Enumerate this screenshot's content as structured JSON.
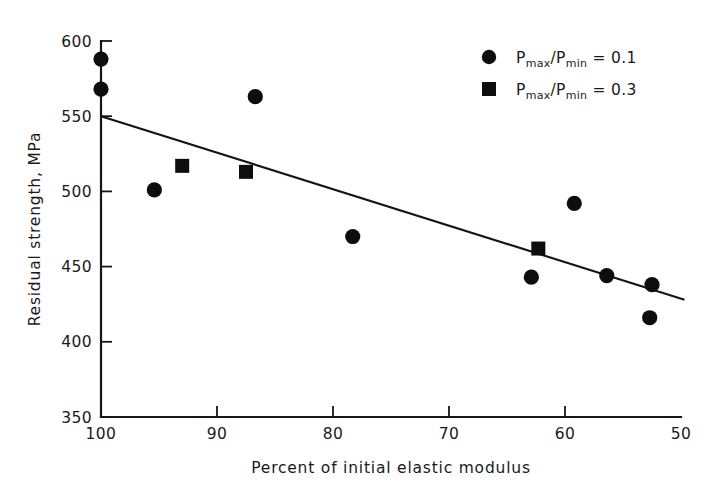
{
  "chart_data": {
    "type": "scatter",
    "title": "",
    "xlabel": "Percent of initial elastic modulus",
    "ylabel": "Residual strength, MPa",
    "xlim": [
      100,
      50
    ],
    "ylim": [
      350,
      600
    ],
    "x_reversed": true,
    "xticks": [
      100,
      90,
      80,
      70,
      60,
      50
    ],
    "yticks": [
      350,
      400,
      450,
      500,
      550,
      600
    ],
    "xtick_labels": [
      "100",
      "90",
      "80",
      "70",
      "60",
      "50"
    ],
    "ytick_labels": [
      "350",
      "400",
      "450",
      "500",
      "550",
      "600"
    ],
    "grid": false,
    "legend_position": "top-right",
    "series": [
      {
        "name": "Pmax/Pmin = 0.1",
        "marker": "circle",
        "color": "#0d0d0d",
        "points": [
          {
            "x": 100.0,
            "y": 588
          },
          {
            "x": 100.0,
            "y": 568
          },
          {
            "x": 95.4,
            "y": 501
          },
          {
            "x": 86.7,
            "y": 563
          },
          {
            "x": 78.3,
            "y": 470
          },
          {
            "x": 62.9,
            "y": 443
          },
          {
            "x": 59.2,
            "y": 492
          },
          {
            "x": 56.4,
            "y": 444
          },
          {
            "x": 52.5,
            "y": 438
          },
          {
            "x": 52.7,
            "y": 416
          }
        ]
      },
      {
        "name": "Pmax/Pmin = 0.3",
        "marker": "square",
        "color": "#0d0d0d",
        "points": [
          {
            "x": 93.0,
            "y": 517
          },
          {
            "x": 87.5,
            "y": 513
          },
          {
            "x": 62.3,
            "y": 462
          }
        ]
      }
    ],
    "trend_line": {
      "name": "linear fit",
      "x_start": 100.0,
      "y_start": 550,
      "x_end": 49.7,
      "y_end": 428
    },
    "legend": [
      {
        "marker": "circle",
        "base": "P",
        "sub1": "max",
        "slash": "/",
        "base2": "P",
        "sub2": "min",
        "equals": " = ",
        "value": "0.1"
      },
      {
        "marker": "square",
        "base": "P",
        "sub1": "max",
        "slash": "/",
        "base2": "P",
        "sub2": "min",
        "equals": " = ",
        "value": "0.3"
      }
    ]
  }
}
